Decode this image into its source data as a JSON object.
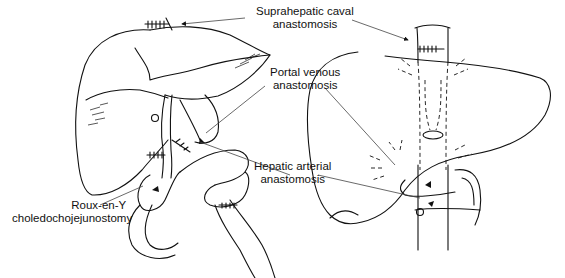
{
  "figure": {
    "type": "surgical anatomy illustration",
    "panels": [
      "anterior view of transplanted liver",
      "posterior view of transplanted liver"
    ]
  },
  "labels": {
    "suprahepatic": {
      "line1": "Suprahepatic caval",
      "line2": "anastomosis"
    },
    "portal": {
      "line1": "Portal venous",
      "line2": "anastomosis"
    },
    "hepatic_arterial": {
      "line1": "Hepatic arterial",
      "line2": "anastomosis"
    },
    "roux": {
      "line1": "Roux-en-Y",
      "line2": "choledochojejunostomy"
    }
  },
  "colors": {
    "ink": "#111111",
    "background": "#ffffff"
  }
}
